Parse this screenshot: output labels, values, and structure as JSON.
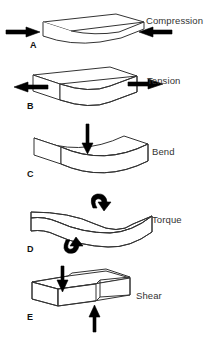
{
  "figure": {
    "width": 208,
    "height": 338,
    "background_color": "#ffffff",
    "line_color": "#333333",
    "arrow_color": "#000000",
    "text_color": "#333333"
  },
  "panels": [
    {
      "letter": "A",
      "label": "Compression",
      "arrows": "two horizontal arrows pointing inward toward the bar",
      "shape": "rectangular bar compressed, slightly bulged ends"
    },
    {
      "letter": "B",
      "label": "Tension",
      "arrows": "two horizontal arrows pointing outward away from the bar",
      "shape": "rectangular bar stretched, narrowed waist"
    },
    {
      "letter": "C",
      "label": "Bend",
      "arrows": "one vertical arrow pointing down onto the top center of the bar",
      "shape": "rectangular bar curved downward in the middle"
    },
    {
      "letter": "D",
      "label": "Torque",
      "arrows": "two curved rotation arrows, one above at right and one below at left",
      "shape": "rectangular bar twisted along its long axis"
    },
    {
      "letter": "E",
      "label": "Shear",
      "arrows": "one arrow pointing down on the top left and one arrow pointing up on the bottom right",
      "shape": "rectangular bar offset/sheared across its midsection"
    }
  ]
}
